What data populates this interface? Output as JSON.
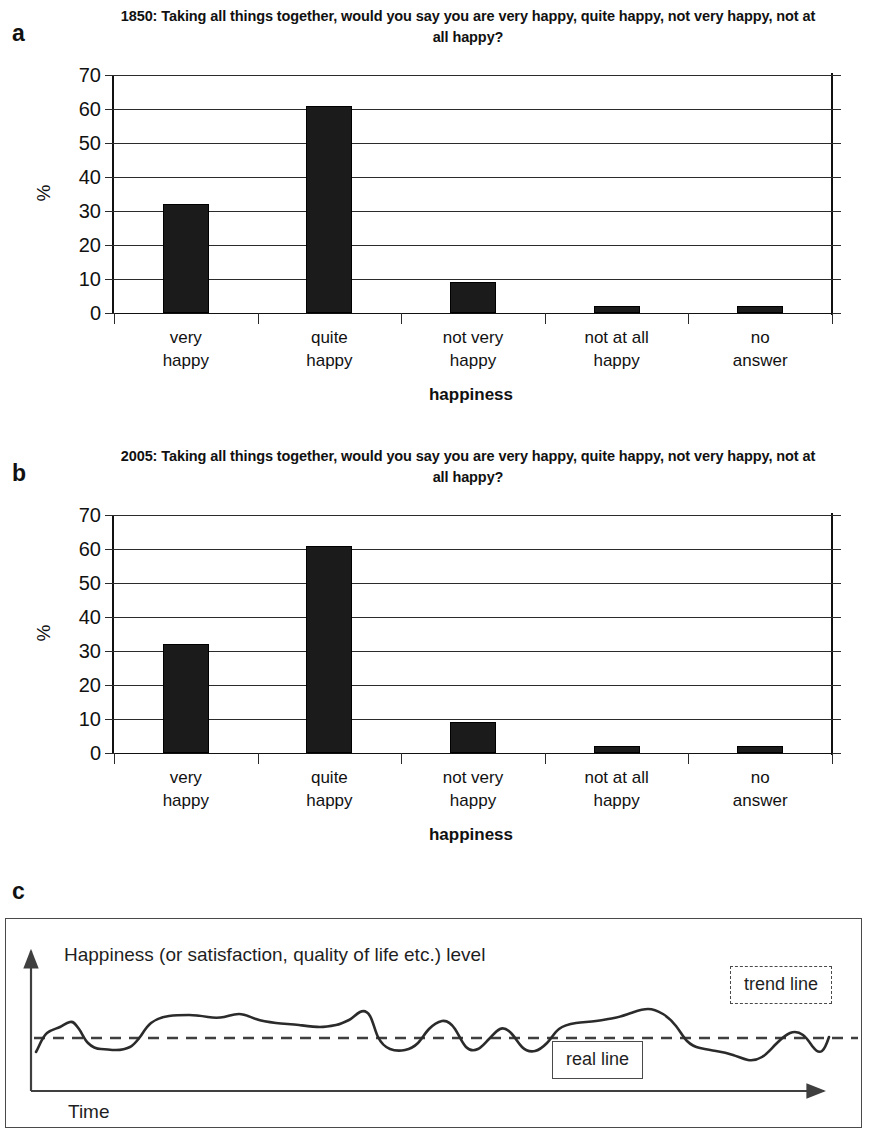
{
  "figure": {
    "panels": [
      {
        "letter": "a",
        "title": "1850: Taking all things together, would you say you are very happy, quite happy, not very happy, not at all happy?"
      },
      {
        "letter": "b",
        "title": "2005: Taking all things together, would you say you are very happy, quite happy, not very happy, not at all happy?"
      },
      {
        "letter": "c",
        "title": ""
      }
    ]
  },
  "panel_c": {
    "y_axis_label": "Happiness (or satisfaction, quality of life etc.) level",
    "x_axis_label": "Time",
    "legend": {
      "trend": "trend line",
      "real": "real line"
    }
  },
  "colors": {
    "bar_fill": "#1b1b1b",
    "axis": "#111111",
    "grid": "#2b2b2b",
    "panel_border": "#4a4a4a"
  },
  "chart_data": [
    {
      "type": "bar",
      "panel": "a",
      "title": "1850: Taking all things together, would you say you are very happy, quite happy, not very happy, not at all happy?",
      "categories": [
        "very happy",
        "quite happy",
        "not very happy",
        "not at all happy",
        "no answer"
      ],
      "values": [
        32,
        61,
        9,
        2,
        2
      ],
      "xlabel": "happiness",
      "ylabel": "%",
      "ylim": [
        0,
        70
      ],
      "yticks": [
        0,
        10,
        20,
        30,
        40,
        50,
        60,
        70
      ],
      "grid": true,
      "legend": "none"
    },
    {
      "type": "bar",
      "panel": "b",
      "title": "2005: Taking all things together, would you say you are very happy, quite happy, not very happy, not at all happy?",
      "categories": [
        "very happy",
        "quite happy",
        "not very happy",
        "not at all happy",
        "no answer"
      ],
      "values": [
        32,
        61,
        9,
        2,
        2
      ],
      "xlabel": "happiness",
      "ylabel": "%",
      "ylim": [
        0,
        70
      ],
      "yticks": [
        0,
        10,
        20,
        30,
        40,
        50,
        60,
        70
      ],
      "grid": true,
      "legend": "none"
    },
    {
      "type": "line",
      "panel": "c",
      "title": "",
      "xlabel": "Time",
      "ylabel": "Happiness (or satisfaction, quality of life etc.) level",
      "grid": false,
      "legend": "inline-boxes",
      "series": [
        {
          "name": "real line",
          "style": "solid",
          "note": "fluctuating series oscillating around a flat trend",
          "x": [
            0,
            2,
            4,
            6,
            8,
            10,
            12,
            14,
            16,
            18,
            20,
            22,
            24,
            26,
            28,
            30,
            32,
            34,
            36,
            38,
            40,
            42,
            44,
            46,
            48,
            50,
            52,
            54,
            56,
            58,
            60,
            62,
            64,
            66,
            68,
            70,
            72,
            74,
            76,
            78,
            80,
            82,
            84,
            86,
            88,
            90,
            92,
            94,
            96,
            98,
            100
          ],
          "y": [
            -14,
            -4,
            2,
            10,
            6,
            -2,
            -3,
            -11,
            -11,
            -4,
            6,
            10,
            12,
            11,
            13,
            10,
            9,
            9,
            9,
            8,
            7,
            7,
            8,
            6,
            14,
            -4,
            -9,
            -6,
            -5,
            -1,
            6,
            0,
            -9,
            -4,
            7,
            -3,
            -8,
            -6,
            2,
            6,
            7,
            8,
            10,
            14,
            12,
            4,
            -5,
            -7,
            -8,
            -6,
            -13,
            -15,
            -6,
            2,
            3,
            -1,
            -2
          ]
        },
        {
          "name": "trend line",
          "style": "dashed",
          "constant_y": 0
        }
      ]
    }
  ]
}
